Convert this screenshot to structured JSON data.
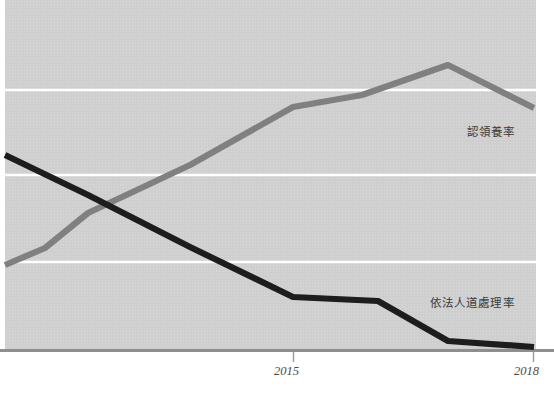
{
  "chart_data": {
    "type": "line",
    "title": "",
    "subtitle": "",
    "xlabel": "",
    "ylabel": "",
    "grid": true,
    "gridlines_horizontal": 3,
    "legend_position": "inline-end-of-line",
    "x": [
      2011,
      2012,
      2013,
      2014,
      2015,
      2016,
      2017,
      2018
    ],
    "xlim": [
      2011,
      2018
    ],
    "ylim": [
      0,
      100
    ],
    "xtick_labels": [
      "2015",
      "2018"
    ],
    "xtick_values": [
      2015,
      2018
    ],
    "series": [
      {
        "name": "認領養率",
        "color": "#808080",
        "values": [
          24,
          29,
          46,
          61,
          69,
          74,
          81,
          69
        ],
        "points_px": [
          {
            "x": 5,
            "y": 265
          },
          {
            "x": 45,
            "y": 248
          },
          {
            "x": 88,
            "y": 213
          },
          {
            "x": 190,
            "y": 165
          },
          {
            "x": 293,
            "y": 107
          },
          {
            "x": 362,
            "y": 95
          },
          {
            "x": 448,
            "y": 65
          },
          {
            "x": 534,
            "y": 108
          }
        ]
      },
      {
        "name": "依法人道處理率",
        "color": "#1d1d1d",
        "values": [
          56,
          50,
          39,
          27,
          15,
          14,
          2,
          1
        ],
        "points_px": [
          {
            "x": 5,
            "y": 155
          },
          {
            "x": 88,
            "y": 195
          },
          {
            "x": 190,
            "y": 247
          },
          {
            "x": 293,
            "y": 297
          },
          {
            "x": 378,
            "y": 301
          },
          {
            "x": 448,
            "y": 341
          },
          {
            "x": 534,
            "y": 347
          }
        ]
      }
    ]
  },
  "labels": {
    "adoption_rate": "認領養率",
    "euthanasia_rate": "依法人道處理率"
  },
  "axis": {
    "tick_2015": "2015",
    "tick_2018": "2018"
  },
  "colors": {
    "plot_background": "#cfcfcf",
    "gridline": "#ffffff",
    "axis_line": "#8e8e8e",
    "series_adoption": "#808080",
    "series_euthanasia": "#1d1d1d",
    "label_text": "#3a3a3a",
    "tick_text": "#4a4a4a"
  }
}
